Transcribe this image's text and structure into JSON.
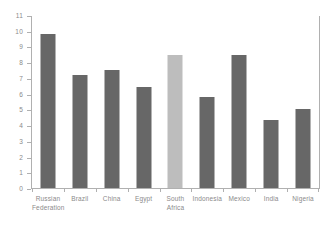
{
  "chart_data": {
    "type": "bar",
    "title": "",
    "xlabel": "",
    "ylabel": "",
    "ylim": [
      0,
      11
    ],
    "grid": false,
    "legend": "none",
    "categories": [
      "Russian\nFederation",
      "Brazil",
      "China",
      "Egypt",
      "South\nAfrica",
      "Indonesia",
      "Mexico",
      "India",
      "Nigeria"
    ],
    "values": [
      9.8,
      7.2,
      7.5,
      6.4,
      8.45,
      5.8,
      8.45,
      4.35,
      5.0
    ],
    "ytick_labels": [
      "11",
      "10",
      "9",
      "8",
      "7",
      "6",
      "5",
      "4",
      "3",
      "2",
      "1",
      "0"
    ],
    "ytick_values": [
      11,
      10,
      9,
      8,
      7,
      6,
      5,
      4,
      3,
      2,
      1,
      0
    ],
    "bar_colors": [
      "#676767",
      "#676767",
      "#676767",
      "#676767",
      "#bdbdbd",
      "#676767",
      "#676767",
      "#676767",
      "#676767"
    ],
    "highlight_category": "South\nAfrica",
    "axis_color": "#b0b0b0",
    "tick_label_color": "#8a8a8a",
    "background_color": "#ffffff"
  }
}
